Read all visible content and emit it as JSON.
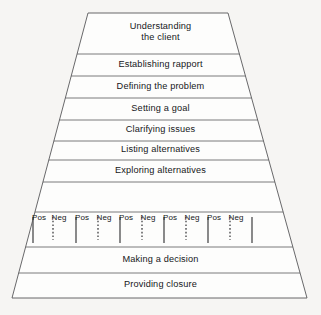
{
  "figure": {
    "name": "counselling-process-pyramid",
    "type": "pyramid-diagram",
    "background_color": "#f6f5f3",
    "stroke_color": "#58585a",
    "text_color": "#16171a",
    "geometry": {
      "top_left_x": 88,
      "top_right_x": 228,
      "top_y": 13,
      "bottom_left_x": 12,
      "bottom_right_x": 307,
      "bottom_y": 298,
      "divider_y": [
        54,
        76,
        98,
        120,
        141,
        160,
        182,
        212,
        247,
        273
      ]
    }
  },
  "bands": [
    {
      "label": "Understanding\nthe client",
      "y_top": 13,
      "y_bottom": 54,
      "center_y": 33,
      "multiline": true
    },
    {
      "label": "Establishing rapport",
      "y_top": 54,
      "y_bottom": 76,
      "center_y": 65,
      "multiline": false
    },
    {
      "label": "Defining the problem",
      "y_top": 76,
      "y_bottom": 98,
      "center_y": 87,
      "multiline": false
    },
    {
      "label": "Setting a goal",
      "y_top": 98,
      "y_bottom": 120,
      "center_y": 109,
      "multiline": false
    },
    {
      "label": "Clarifying issues",
      "y_top": 120,
      "y_bottom": 141,
      "center_y": 130.5,
      "multiline": false
    },
    {
      "label": "Listing alternatives",
      "y_top": 141,
      "y_bottom": 160,
      "center_y": 150.5,
      "multiline": false
    },
    {
      "label": "Exploring alternatives",
      "y_top": 160,
      "y_bottom": 182,
      "center_y": 171,
      "multiline": false
    },
    {
      "label": "Making a decision",
      "y_top": 247,
      "y_bottom": 273,
      "center_y": 260,
      "multiline": false
    },
    {
      "label": "Providing closure",
      "y_top": 273,
      "y_bottom": 298,
      "center_y": 285.5,
      "multiline": false
    }
  ],
  "posneg_row": {
    "y_top": 212,
    "y_bottom": 247,
    "label_baseline_y": 213,
    "tick_top_y": 217,
    "solid_tick_bottom_y": 243,
    "dotted_tick_bottom_y": 240,
    "pair_count": 5,
    "pos_label": "Pos",
    "neg_label": "Neg",
    "items": [
      {
        "label": "Pos",
        "style": "solid",
        "tick_x": 33,
        "label_x": 39
      },
      {
        "label": "Neg",
        "style": "dotted",
        "tick_x": 53,
        "label_x": 59
      },
      {
        "label": "Pos",
        "style": "solid",
        "tick_x": 76,
        "label_x": 82
      },
      {
        "label": "Neg",
        "style": "dotted",
        "tick_x": 98,
        "label_x": 104
      },
      {
        "label": "Pos",
        "style": "solid",
        "tick_x": 120,
        "label_x": 126
      },
      {
        "label": "Neg",
        "style": "dotted",
        "tick_x": 142,
        "label_x": 148
      },
      {
        "label": "Pos",
        "style": "solid",
        "tick_x": 164,
        "label_x": 170
      },
      {
        "label": "Neg",
        "style": "dotted",
        "tick_x": 186,
        "label_x": 192
      },
      {
        "label": "Pos",
        "style": "solid",
        "tick_x": 208,
        "label_x": 214
      },
      {
        "label": "Neg",
        "style": "dotted",
        "tick_x": 230,
        "label_x": 236
      },
      {
        "label": "",
        "style": "solid",
        "tick_x": 252,
        "label_x": null
      }
    ]
  }
}
